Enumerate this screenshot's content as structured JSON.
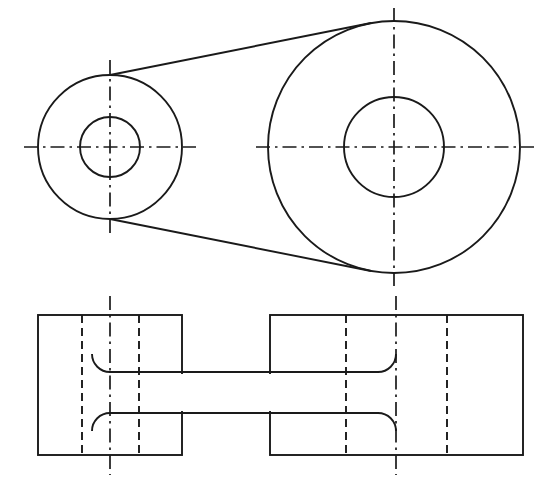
{
  "document": {
    "title": "Orthographic Engineering Drawing",
    "subject": "Two-boss connecting link / crank arm",
    "background_color": "#ffffff",
    "line_color": "#1a1a1a",
    "canvas": {
      "width": 547,
      "height": 492
    }
  },
  "views": [
    {
      "id": "top-view",
      "name": "Top View (plan) - two circular bosses joined by tangent web",
      "features": {
        "small_boss": {
          "label": "Small boss",
          "center_x": 110,
          "center_y": 147,
          "outer_radius": 72,
          "bore_radius": 30
        },
        "large_boss": {
          "label": "Large boss",
          "center_x": 394,
          "center_y": 147,
          "outer_radius": 126,
          "bore_radius": 50
        },
        "web_tangents": [
          {
            "label": "upper tangent",
            "x1": 110,
            "y1": 75,
            "x2": 371,
            "y2": 23
          },
          {
            "label": "lower tangent",
            "x1": 110,
            "y1": 219,
            "x2": 371,
            "y2": 271
          }
        ],
        "center_lines": {
          "horizontal_y": 147,
          "small_vertical_x": 110,
          "large_vertical_x": 394,
          "small_h_extent": [
            24,
            196
          ],
          "large_h_extent": [
            256,
            534
          ],
          "small_v_extent": [
            60,
            234
          ],
          "large_v_extent": [
            8,
            286
          ]
        }
      }
    },
    {
      "id": "front-view",
      "name": "Front View (elevation) - sectioned blocks with hidden bore lines",
      "features": {
        "left_block": {
          "label": "Left boss block",
          "x": 38,
          "y": 315,
          "width": 144,
          "height": 140,
          "hidden_lines_x": [
            82,
            139
          ],
          "center_line_x": 110,
          "center_line_extent": [
            296,
            475
          ]
        },
        "right_block": {
          "label": "Right boss block",
          "x": 270,
          "y": 315,
          "width": 253,
          "height": 140,
          "hidden_lines_x": [
            346,
            447
          ],
          "center_line_x": 396,
          "center_line_extent": [
            296,
            475
          ]
        },
        "web": {
          "label": "Connecting web / rib",
          "top_y": 372,
          "bottom_y": 413,
          "left_x": 110,
          "right_x": 396,
          "fillet_radius": 18
        }
      }
    }
  ],
  "line_types": [
    {
      "name": "visible-edge",
      "description": "Continuous thick object line",
      "color": "#1a1a1a"
    },
    {
      "name": "hidden-edge",
      "description": "Short dashed hidden line",
      "color": "#1a1a1a"
    },
    {
      "name": "center-line",
      "description": "Long dash dot centre line",
      "color": "#1a1a1a"
    }
  ]
}
